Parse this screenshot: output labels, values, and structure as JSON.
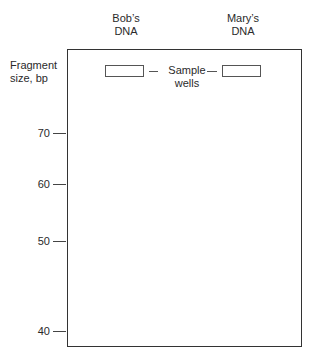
{
  "lanes": [
    {
      "line1": "Bob’s",
      "line2": "DNA"
    },
    {
      "line1": "Mary’s",
      "line2": "DNA"
    }
  ],
  "y_axis": {
    "title_line1": "Fragment",
    "title_line2": "size, bp"
  },
  "wells_label": {
    "line1": "Sample",
    "line2": "wells"
  },
  "ticks": [
    {
      "value": "70",
      "y": 133
    },
    {
      "value": "60",
      "y": 184
    },
    {
      "value": "50",
      "y": 241
    },
    {
      "value": "40",
      "y": 331
    }
  ],
  "colors": {
    "outline": "#333333",
    "text": "#2a2a2a",
    "background": "#ffffff"
  }
}
